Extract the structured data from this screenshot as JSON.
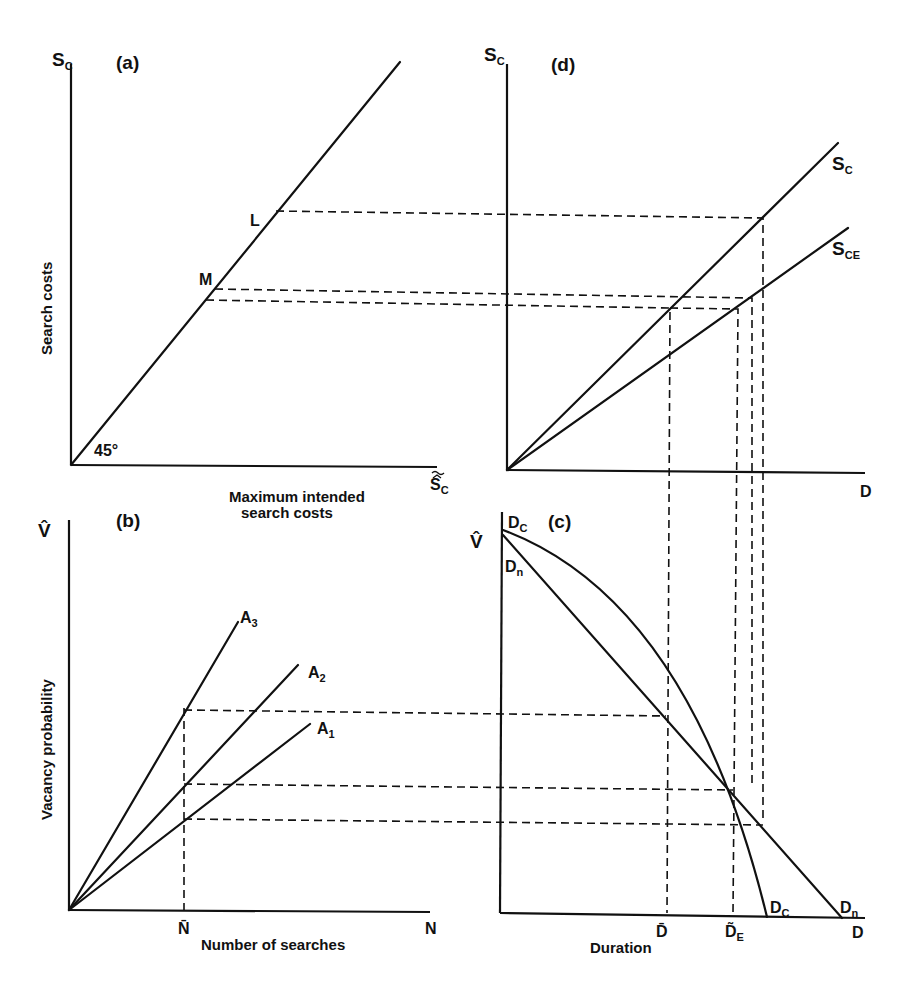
{
  "panels": {
    "a": {
      "tag": "(a)",
      "y_axis_symbol": "S",
      "y_axis_sub": "C",
      "y_axis_title": "Search costs",
      "x_axis_symbol": "S",
      "x_axis_sub": "C",
      "x_axis_accent": "˜^",
      "x_axis_title_line1": "Maximum intended",
      "x_axis_title_line2": "search costs",
      "angle_label": "45°",
      "point_L": "L",
      "point_M": "M"
    },
    "b": {
      "tag": "(b)",
      "y_axis_symbol": "V̂",
      "y_axis_title": "Vacancy probability",
      "x_axis_symbol": "N",
      "x_axis_title": "Number of searches",
      "x_tick": "N̄",
      "curves": [
        {
          "name": "A",
          "sub": "3"
        },
        {
          "name": "A",
          "sub": "2"
        },
        {
          "name": "A",
          "sub": "1"
        }
      ]
    },
    "c": {
      "tag": "(c)",
      "y_axis_symbol": "V̂",
      "x_axis_symbol": "D",
      "x_axis_title": "Duration",
      "x_tick_1": "D̄",
      "x_tick_2": "D̃",
      "x_tick_2_sub": "E",
      "curve_top_c": {
        "name": "D",
        "sub": "C"
      },
      "curve_top_n": {
        "name": "D",
        "sub": "n"
      },
      "curve_end_c": {
        "name": "D",
        "sub": "C"
      },
      "curve_end_n": {
        "name": "D",
        "sub": "n"
      }
    },
    "d": {
      "tag": "(d)",
      "y_axis_symbol": "S",
      "y_axis_sub": "C",
      "x_axis_symbol": "D",
      "line_sc": {
        "name": "S",
        "sub": "C"
      },
      "line_sce": {
        "name": "S",
        "sub": "CE"
      }
    }
  }
}
